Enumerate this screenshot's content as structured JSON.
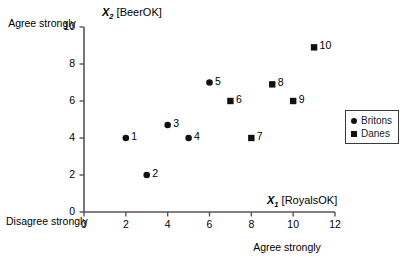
{
  "chart_data": {
    "type": "scatter",
    "title": "",
    "xlabel": "X1 [RoyalsOK]",
    "ylabel": "X2 [BeerOK]",
    "xlim": [
      0,
      12
    ],
    "ylim": [
      0,
      10
    ],
    "xticks": [
      0,
      2,
      4,
      6,
      8,
      10,
      12
    ],
    "yticks": [
      0,
      2,
      4,
      6,
      8,
      10
    ],
    "grid": false,
    "legend_position": "right",
    "series": [
      {
        "name": "Britons",
        "marker": "circle",
        "points": [
          {
            "label": "1",
            "x": 2.0,
            "y": 4.0
          },
          {
            "label": "2",
            "x": 3.0,
            "y": 2.0
          },
          {
            "label": "3",
            "x": 4.0,
            "y": 4.7
          },
          {
            "label": "4",
            "x": 5.0,
            "y": 4.0
          },
          {
            "label": "5",
            "x": 6.0,
            "y": 7.0
          }
        ]
      },
      {
        "name": "Danes",
        "marker": "square",
        "points": [
          {
            "label": "6",
            "x": 7.0,
            "y": 6.0
          },
          {
            "label": "7",
            "x": 8.0,
            "y": 4.0
          },
          {
            "label": "8",
            "x": 9.0,
            "y": 6.9
          },
          {
            "label": "9",
            "x": 10.0,
            "y": 6.0
          },
          {
            "label": "10",
            "x": 11.0,
            "y": 8.9
          }
        ]
      }
    ]
  },
  "annotations": {
    "y_top_corner": "Agree strongly",
    "y_bottom_corner": "Disagree strongly",
    "x_right_corner": "Agree strongly"
  },
  "axis_titles": {
    "y_var": "X",
    "y_sub": "2",
    "y_bracket": "[BeerOK]",
    "x_var": "X",
    "x_sub": "1",
    "x_bracket": "[RoyalsOK]"
  },
  "legend": {
    "items": [
      {
        "label": "Britons",
        "marker": "circle"
      },
      {
        "label": "Danes",
        "marker": "square"
      }
    ]
  },
  "colors": {
    "marker": "#111111",
    "axis": "#555555",
    "text": "#000000"
  }
}
